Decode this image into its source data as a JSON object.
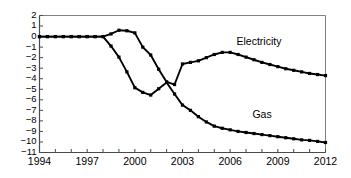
{
  "chart_data": {
    "type": "line",
    "title": "",
    "subtitle": "",
    "xlabel": "",
    "ylabel": "",
    "xlim": [
      1994,
      2012
    ],
    "ylim": [
      -11,
      2
    ],
    "grid": false,
    "legend_position": "inline-annotation",
    "x_tick_labels": [
      "1994",
      "1997",
      "2000",
      "2003",
      "2006",
      "2009",
      "2012"
    ],
    "x_tick_values": [
      1994,
      1997,
      2000,
      2003,
      2006,
      2009,
      2012
    ],
    "x_minor_tick_step": 1,
    "y_tick_labels": [
      "2",
      "1",
      "0",
      "−1",
      "−2",
      "−3",
      "−4",
      "−5",
      "−6",
      "−7",
      "−8",
      "−9",
      "−10",
      "−11"
    ],
    "y_tick_values": [
      2,
      1,
      0,
      -1,
      -2,
      -3,
      -4,
      -5,
      -6,
      -7,
      -8,
      -9,
      -10,
      -11
    ],
    "marker": "square",
    "line_color": "#000000",
    "axis_color": "#808080",
    "series": [
      {
        "name": "Electricity",
        "label_x": 2006.4,
        "label_y": -0.55,
        "x": [
          1994,
          1994.5,
          1995,
          1995.5,
          1996,
          1996.5,
          1997,
          1997.5,
          1998,
          1998.5,
          1999,
          1999.5,
          2000,
          2000.5,
          2001,
          2001.5,
          2002,
          2002.5,
          2003,
          2003.5,
          2004,
          2004.5,
          2005,
          2005.5,
          2006,
          2006.5,
          2007,
          2007.5,
          2008,
          2008.5,
          2009,
          2009.5,
          2010,
          2010.5,
          2011,
          2011.5,
          2012
        ],
        "y": [
          0,
          0,
          0,
          0,
          0,
          0,
          0,
          0,
          0,
          0.25,
          0.6,
          0.55,
          0.35,
          -1.0,
          -1.75,
          -3.1,
          -4.3,
          -4.55,
          -2.6,
          -2.45,
          -2.3,
          -2.0,
          -1.7,
          -1.5,
          -1.5,
          -1.7,
          -1.95,
          -2.2,
          -2.45,
          -2.65,
          -2.85,
          -3.05,
          -3.2,
          -3.35,
          -3.5,
          -3.6,
          -3.7
        ]
      },
      {
        "name": "Gas",
        "label_x": 2007.4,
        "label_y": -7.45,
        "x": [
          1994,
          1994.5,
          1995,
          1995.5,
          1996,
          1996.5,
          1997,
          1997.5,
          1998,
          1998.5,
          1999,
          1999.5,
          2000,
          2000.5,
          2001,
          2001.5,
          2002,
          2002.5,
          2003,
          2003.5,
          2004,
          2004.5,
          2005,
          2005.5,
          2006,
          2006.5,
          2007,
          2007.5,
          2008,
          2008.5,
          2009,
          2009.5,
          2010,
          2010.5,
          2011,
          2011.5,
          2012
        ],
        "y": [
          0,
          0,
          0,
          0,
          0,
          0,
          0,
          0,
          0,
          -0.9,
          -1.95,
          -3.35,
          -4.85,
          -5.3,
          -5.55,
          -4.95,
          -4.35,
          -5.45,
          -6.5,
          -7.0,
          -7.6,
          -8.1,
          -8.5,
          -8.7,
          -8.85,
          -9.0,
          -9.1,
          -9.2,
          -9.3,
          -9.4,
          -9.5,
          -9.6,
          -9.7,
          -9.8,
          -9.85,
          -9.95,
          -10.05
        ]
      }
    ]
  }
}
